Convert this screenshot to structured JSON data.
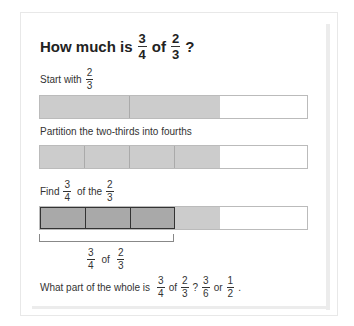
{
  "title": {
    "prefix": "How much is",
    "frac1": {
      "n": "3",
      "d": "4"
    },
    "of": "of",
    "frac2": {
      "n": "2",
      "d": "3"
    },
    "suffix": "?"
  },
  "step1": {
    "text": "Start with",
    "frac": {
      "n": "2",
      "d": "3"
    }
  },
  "step2": {
    "text": "Partition the two-thirds into fourths"
  },
  "step3": {
    "text1": "Find",
    "frac1": {
      "n": "3",
      "d": "4"
    },
    "text2": "of the",
    "frac2": {
      "n": "2",
      "d": "3"
    }
  },
  "bracket_label": {
    "frac1": {
      "n": "3",
      "d": "4"
    },
    "of": "of",
    "frac2": {
      "n": "2",
      "d": "3"
    }
  },
  "answer": {
    "text1": "What part of the whole is",
    "f1": {
      "n": "3",
      "d": "4"
    },
    "of": "of",
    "f2": {
      "n": "2",
      "d": "3"
    },
    "q": "?",
    "f3": {
      "n": "3",
      "d": "6"
    },
    "or": "or",
    "f4": {
      "n": "1",
      "d": "2"
    },
    "end": "."
  },
  "colors": {
    "light_fill": "#cccccc",
    "dark_fill": "#a9a9a9",
    "empty": "#ffffff",
    "border": "#bbbbbb",
    "dark_border": "#333333"
  }
}
